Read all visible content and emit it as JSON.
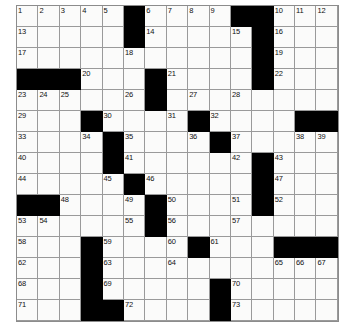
{
  "puzzle": {
    "title": "Crossword Puzzle Grid",
    "rows": 15,
    "cols": 15,
    "cell_size_px": 21,
    "colors": {
      "block": "#000000",
      "open": "#fbfbfa",
      "gridline": "#9a9a9a",
      "number_text": "#111111",
      "page_background": "#ffffff"
    },
    "grid": [
      [
        "1",
        "2",
        "3",
        "4",
        "5",
        "#",
        "6",
        "7",
        "8",
        "9",
        "#",
        "#",
        "10",
        "11",
        "12"
      ],
      [
        "13",
        "",
        "",
        "",
        "",
        "#",
        "14",
        "",
        "",
        "",
        "15",
        "#",
        "16",
        "",
        ""
      ],
      [
        "17",
        "",
        "",
        "",
        "",
        "18",
        "",
        "",
        "",
        "",
        "",
        "#",
        "19",
        "",
        ""
      ],
      [
        "#",
        "#",
        "#",
        "20",
        "",
        "",
        "#",
        "21",
        "",
        "",
        "",
        "#",
        "22",
        "",
        ""
      ],
      [
        "23",
        "24",
        "25",
        "",
        "",
        "26",
        "#",
        "",
        "27",
        "",
        "28",
        "",
        "",
        "",
        ""
      ],
      [
        "29",
        "",
        "",
        "#",
        "30",
        "",
        "",
        "31",
        "#",
        "32",
        "",
        "",
        "",
        "#",
        "#"
      ],
      [
        "33",
        "",
        "",
        "34",
        "#",
        "35",
        "",
        "",
        "36",
        "#",
        "37",
        "",
        "",
        "38",
        "39"
      ],
      [
        "40",
        "",
        "",
        "",
        "#",
        "41",
        "",
        "",
        "",
        "",
        "42",
        "#",
        "43",
        "",
        ""
      ],
      [
        "44",
        "",
        "",
        "",
        "45",
        "#",
        "46",
        "",
        "",
        "",
        "",
        "#",
        "47",
        "",
        ""
      ],
      [
        "#",
        "#",
        "48",
        "",
        "",
        "49",
        "#",
        "50",
        "",
        "",
        "51",
        "#",
        "52",
        "",
        ""
      ],
      [
        "53",
        "54",
        "",
        "",
        "",
        "55",
        "#",
        "56",
        "",
        "",
        "57",
        "",
        "",
        "",
        ""
      ],
      [
        "58",
        "",
        "",
        "#",
        "59",
        "",
        "",
        "60",
        "#",
        "61",
        "",
        "",
        "#",
        "#",
        "#"
      ],
      [
        "62",
        "",
        "",
        "#",
        "63",
        "",
        "",
        "64",
        "",
        "",
        "",
        "",
        "65",
        "66",
        "67"
      ],
      [
        "68",
        "",
        "",
        "#",
        "69",
        "",
        "",
        "",
        "",
        "#",
        "70",
        "",
        "",
        "",
        ""
      ],
      [
        "71",
        "",
        "",
        "#",
        "#",
        "72",
        "",
        "",
        "",
        "#",
        "73",
        "",
        "",
        "",
        ""
      ]
    ],
    "numbers_visible": [
      "1",
      "2",
      "3",
      "4",
      "5",
      "6",
      "7",
      "8",
      "9",
      "10",
      "11",
      "12",
      "13",
      "14",
      "15",
      "16",
      "17",
      "18",
      "19",
      "20",
      "21",
      "22",
      "23",
      "24",
      "25",
      "26",
      "27",
      "28",
      "29",
      "30",
      "31",
      "32",
      "33",
      "34",
      "35",
      "36",
      "37",
      "38",
      "39",
      "40",
      "41",
      "42",
      "43",
      "44",
      "45",
      "46",
      "47",
      "48",
      "49",
      "50",
      "51",
      "52",
      "53",
      "54",
      "55",
      "56",
      "57",
      "58",
      "59",
      "60",
      "61",
      "62",
      "63",
      "64",
      "65",
      "66",
      "67",
      "68",
      "69",
      "70",
      "71",
      "72",
      "73"
    ],
    "answers": []
  }
}
